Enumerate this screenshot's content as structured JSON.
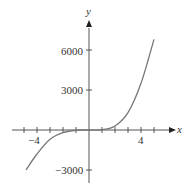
{
  "chart_data": {
    "type": "line",
    "title": "",
    "xlabel": "x",
    "ylabel": "y",
    "xlim": [
      -5.5,
      6.5
    ],
    "ylim": [
      -4000,
      7000
    ],
    "x_ticks": [
      -5,
      -4,
      -3,
      -2,
      -1,
      1,
      2,
      3,
      4,
      5
    ],
    "x_tick_labels": [
      {
        "value": -4,
        "label": "−4"
      },
      {
        "value": 4,
        "label": "4"
      }
    ],
    "y_ticks": [
      -3000,
      3000,
      6000
    ],
    "y_tick_labels": [
      {
        "value": 6000,
        "label": "6000"
      },
      {
        "value": 3000,
        "label": "3000"
      },
      {
        "value": -3000,
        "label": "−3000"
      }
    ],
    "grid": false,
    "legend": null,
    "series": [
      {
        "name": "f(x)",
        "x": [
          -4.85,
          -4,
          -3,
          -2,
          -1,
          0,
          1,
          2,
          3,
          4,
          5
        ],
        "y": [
          -3000,
          -1800,
          -700,
          -200,
          -20,
          0,
          20,
          300,
          1300,
          3500,
          6800
        ]
      }
    ],
    "colors": {
      "curve": "#777777",
      "axes": "#555555",
      "text": "#333333"
    }
  }
}
